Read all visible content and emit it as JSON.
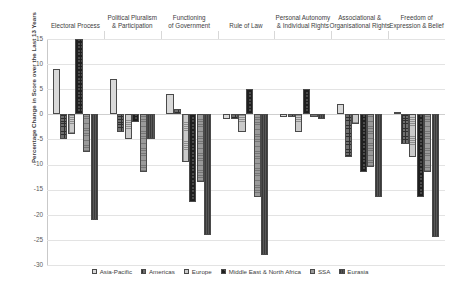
{
  "chart_data": {
    "type": "bar",
    "title": "",
    "xlabel": "",
    "ylabel": "Percentage Change in Score over the Last 13 Years",
    "ylim": [
      -30,
      15
    ],
    "ytick_values": [
      15,
      10,
      5,
      0,
      -5,
      -10,
      -15,
      -20,
      -25,
      -30
    ],
    "ytick_labels": [
      "15",
      "10",
      "5",
      "0",
      "-5",
      "-10",
      "-15",
      "-20",
      "-25",
      "-30"
    ],
    "grid": true,
    "legend_position": "bottom",
    "categories": [
      "Electoral Process",
      "Political Pluralism & Participation",
      "Functioning of Government",
      "Rule of Law",
      "Personal Autonomy & Individual Rights",
      "Associational & Organisational Rights",
      "Freedom of Expression & Belief"
    ],
    "series": [
      {
        "name": "Asia-Pacific",
        "values": [
          9,
          7,
          4,
          -1,
          -0.5,
          2,
          0.5
        ]
      },
      {
        "name": "Americas",
        "values": [
          -5,
          -3.5,
          1,
          -1,
          -0.5,
          -8.5,
          -6
        ]
      },
      {
        "name": "Europe",
        "values": [
          -4,
          -5,
          -9.5,
          -3.5,
          -3.5,
          -2,
          -8.5
        ]
      },
      {
        "name": "Middle East & North Africa",
        "values": [
          15,
          -1.5,
          -17.5,
          5,
          5,
          -11.5,
          -16.5
        ]
      },
      {
        "name": "SSA",
        "values": [
          -7.5,
          -11.5,
          -13.5,
          -16.5,
          -0.5,
          -10.5,
          -11.5
        ]
      },
      {
        "name": "Eurasia",
        "values": [
          -21,
          -5,
          -24,
          -28,
          -1,
          -16.5,
          -24.5
        ]
      }
    ]
  },
  "legend": {
    "items": [
      {
        "label": "Asia-Pacific"
      },
      {
        "label": "Americas"
      },
      {
        "label": "Europe"
      },
      {
        "label": "Middle East & North Africa"
      },
      {
        "label": "SSA"
      },
      {
        "label": "Eurasia"
      }
    ]
  }
}
